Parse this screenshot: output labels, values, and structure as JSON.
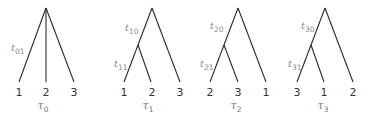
{
  "trees": [
    {
      "name": "τ0",
      "tau_symbol": "τ",
      "tau_sub": "0",
      "branch_labels": [
        {
          "symbol": "t",
          "sub": "01"
        }
      ],
      "leaves": [
        "1",
        "2",
        "3"
      ]
    },
    {
      "name": "τ1",
      "tau_symbol": "τ",
      "tau_sub": "1",
      "branch_labels": [
        {
          "symbol": "t",
          "sub": "10"
        },
        {
          "symbol": "t",
          "sub": "11"
        }
      ],
      "leaves": [
        "1",
        "2",
        "3"
      ]
    },
    {
      "name": "τ2",
      "tau_symbol": "τ",
      "tau_sub": "2",
      "branch_labels": [
        {
          "symbol": "t",
          "sub": "20"
        },
        {
          "symbol": "t",
          "sub": "21"
        }
      ],
      "leaves": [
        "2",
        "3",
        "1"
      ]
    },
    {
      "name": "τ3",
      "tau_symbol": "τ",
      "tau_sub": "3",
      "branch_labels": [
        {
          "symbol": "t",
          "sub": "30"
        },
        {
          "symbol": "t",
          "sub": "31"
        }
      ],
      "leaves": [
        "3",
        "1",
        "2"
      ]
    }
  ],
  "colors": {
    "edge": "#2a2a2a",
    "leaf_text": "#333333",
    "branch_label": "#8a8a8a",
    "tree_label": "#7a7a7a"
  }
}
